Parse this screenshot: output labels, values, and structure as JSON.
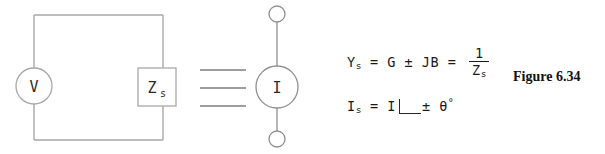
{
  "figure": {
    "caption": "Figure 6.34",
    "stroke_color": "#a8a8a8",
    "text_color": "#2b2b2b"
  },
  "left_circuit": {
    "name": "thevenin-voltage-source-circuit",
    "voltage_source_label": "V",
    "impedance_label": "Z",
    "impedance_subscript": "s"
  },
  "equivalence": {
    "symbol_name": "equals-sign",
    "line_count": 3
  },
  "right_circuit": {
    "name": "norton-current-source-circuit",
    "current_source_label": "I",
    "terminal_top_name": "terminal-node-top",
    "terminal_bottom_name": "terminal-node-bottom"
  },
  "equations": {
    "admittance": {
      "lhs": "Y",
      "lhs_sub": "s",
      "eq1": "=",
      "conductance": "G",
      "pm": "±",
      "susceptance": "JB",
      "eq2": "=",
      "numerator": "1",
      "denominator": "Z",
      "denominator_sub": "s",
      "plain_text": "Ys = G ± JB = 1/Zs"
    },
    "source_current": {
      "lhs": "I",
      "lhs_sub": "s",
      "eq1": "=",
      "magnitude": "I",
      "angle_symbol": "∠",
      "pm": "±",
      "theta": "θ",
      "degree": "°",
      "plain_text": "Is = I ∠± θ°"
    }
  }
}
